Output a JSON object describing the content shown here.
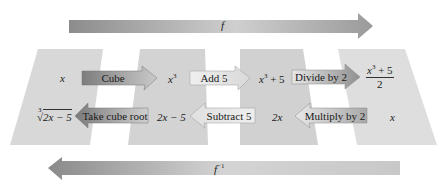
{
  "diagram": {
    "forward_function": {
      "label": "f",
      "direction": "right"
    },
    "inverse_function": {
      "label": "f",
      "superscript": "−1",
      "direction": "left"
    },
    "columns": [
      {
        "top": "x",
        "bottom": "∛(2x − 5)"
      },
      {
        "top": "x³",
        "bottom": "2x − 5"
      },
      {
        "top": "x³ + 5",
        "bottom": "2x"
      },
      {
        "top": "(x³ + 5)/2",
        "bottom": "x"
      }
    ],
    "forward_steps": [
      {
        "label": "Cube",
        "from": "x",
        "to": "x³"
      },
      {
        "label": "Add 5",
        "from": "x³",
        "to": "x³ + 5"
      },
      {
        "label": "Divide by 2",
        "from": "x³ + 5",
        "to": "(x³ + 5)/2"
      }
    ],
    "inverse_steps": [
      {
        "label": "Take cube root",
        "from": "2x − 5",
        "to": "∛(2x − 5)"
      },
      {
        "label": "Subtract 5",
        "from": "2x",
        "to": "2x − 5"
      },
      {
        "label": "Multiply by 2",
        "from": "x",
        "to": "2x"
      }
    ]
  },
  "text": {
    "f": "f",
    "finv_base": "f",
    "finv_sup": "−1",
    "c1_top": "x",
    "c1_bot_index": "3",
    "c1_bot_radical": "√",
    "c1_bot_radicand": "2x − 5",
    "c2_top_base": "x",
    "c2_top_sup": "3",
    "c2_bot": "2x − 5",
    "c3_top_base": "x",
    "c3_top_sup": "3",
    "c3_top_rest": " + 5",
    "c3_bot": "2x",
    "c4_top_num_base": "x",
    "c4_top_num_sup": "3",
    "c4_top_num_rest": " + 5",
    "c4_top_den": "2",
    "c4_bot": "x",
    "op_cube": "Cube",
    "op_add5": "Add 5",
    "op_div2": "Divide by 2",
    "op_cuberoot": "Take cube root",
    "op_sub5": "Subtract 5",
    "op_mul2": "Multiply by 2"
  },
  "colors": {
    "panel": "#d6d6d6",
    "arrow_dark": "#8a8a8a",
    "arrow_light": "#e2e2e2",
    "background": "#ffffff"
  }
}
